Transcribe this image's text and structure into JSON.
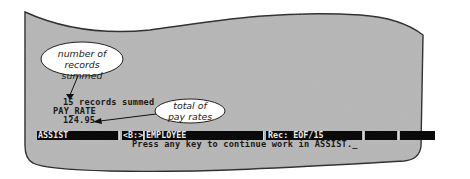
{
  "screen": {
    "background_color": "#b3b3b3",
    "outline_color": "#2a2a2a"
  },
  "output": {
    "records_line": "15 records summed",
    "field_name": "PAY_RATE",
    "field_total": "124.95"
  },
  "status_bar": {
    "mode": "ASSIST",
    "drive": "<B:>",
    "database": "EMPLOYEE",
    "record": "Rec: EOF/15",
    "slot5": "",
    "slot6": ""
  },
  "prompt": {
    "message": "Press any key to continue work in ASSIST.",
    "cursor": "_"
  },
  "callouts": [
    {
      "line1": "number of records",
      "line2": "summed"
    },
    {
      "line1": "total of",
      "line2": "pay rates"
    }
  ]
}
